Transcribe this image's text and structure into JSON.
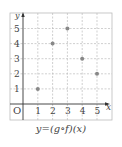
{
  "chart_data": {
    "type": "scatter",
    "title": "",
    "caption": "y=(g∘f)(x)",
    "xlabel": "x",
    "ylabel": "y",
    "origin_label": "O",
    "x_ticks": [
      1,
      2,
      3,
      4,
      5
    ],
    "y_ticks": [
      1,
      2,
      3,
      4,
      5
    ],
    "xlim": [
      0,
      5.5
    ],
    "ylim": [
      0,
      5.5
    ],
    "grid": true,
    "points": [
      {
        "x": 1,
        "y": 1
      },
      {
        "x": 2,
        "y": 4
      },
      {
        "x": 3,
        "y": 5
      },
      {
        "x": 4,
        "y": 3
      },
      {
        "x": 5,
        "y": 2
      }
    ],
    "colors": {
      "point": "#888888",
      "axis": "#333333",
      "grid": "#bbbbbb"
    }
  }
}
